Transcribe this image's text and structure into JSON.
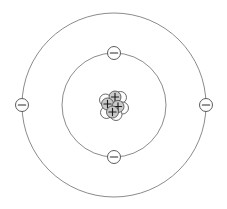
{
  "diagram": {
    "element_name": "Beryllium",
    "element_symbol": "Be",
    "atomic_number": 4,
    "mass_number": 9,
    "background_color": "#ffffff",
    "orbit_stroke_color": "#6d6d6d",
    "electron_fill_color": "#ffffff",
    "electron_stroke_color": "#4a4a4a",
    "proton_fill_color": "#c9c9c9",
    "neutron_fill_color": "#fdfdfd",
    "particle_stroke_color": "#3a3a3a",
    "center": {
      "x": 114,
      "y": 105
    }
  },
  "shells": [
    {
      "name": "inner-shell",
      "label": "K shell",
      "radius": 52,
      "electron_count": 2,
      "electrons": [
        {
          "name": "electron-inner-top",
          "label": "-",
          "angle_deg": 270,
          "x": 114,
          "y": 53,
          "radius": 6.5
        },
        {
          "name": "electron-inner-bottom",
          "label": "-",
          "angle_deg": 90,
          "x": 114,
          "y": 157,
          "radius": 6.5
        }
      ]
    },
    {
      "name": "outer-shell",
      "label": "L shell",
      "radius": 92,
      "electron_count": 2,
      "electrons": [
        {
          "name": "electron-outer-left",
          "label": "-",
          "angle_deg": 180,
          "x": 22,
          "y": 105,
          "radius": 6.5
        },
        {
          "name": "electron-outer-right",
          "label": "-",
          "angle_deg": 0,
          "x": 206,
          "y": 105,
          "radius": 6.5
        }
      ]
    }
  ],
  "nucleus": {
    "name": "nucleus",
    "proton_count": 4,
    "neutron_count": 5,
    "proton_label": "+",
    "neutron_label": "",
    "particle_radius": 6.0,
    "neutrons": [
      {
        "name": "neutron-1",
        "x": 120.5,
        "y": 97.5
      },
      {
        "name": "neutron-2",
        "x": 105.5,
        "y": 100.0
      },
      {
        "name": "neutron-3",
        "x": 122.5,
        "y": 108.0
      },
      {
        "name": "neutron-4",
        "x": 106.5,
        "y": 112.5
      },
      {
        "name": "neutron-5",
        "x": 116.0,
        "y": 114.5
      }
    ],
    "protons": [
      {
        "name": "proton-1",
        "x": 115.0,
        "y": 97.0,
        "label": "+"
      },
      {
        "name": "proton-2",
        "x": 107.5,
        "y": 104.0,
        "label": "+"
      },
      {
        "name": "proton-3",
        "x": 118.0,
        "y": 106.5,
        "label": "+"
      },
      {
        "name": "proton-4",
        "x": 112.5,
        "y": 112.0,
        "label": "+"
      }
    ]
  }
}
